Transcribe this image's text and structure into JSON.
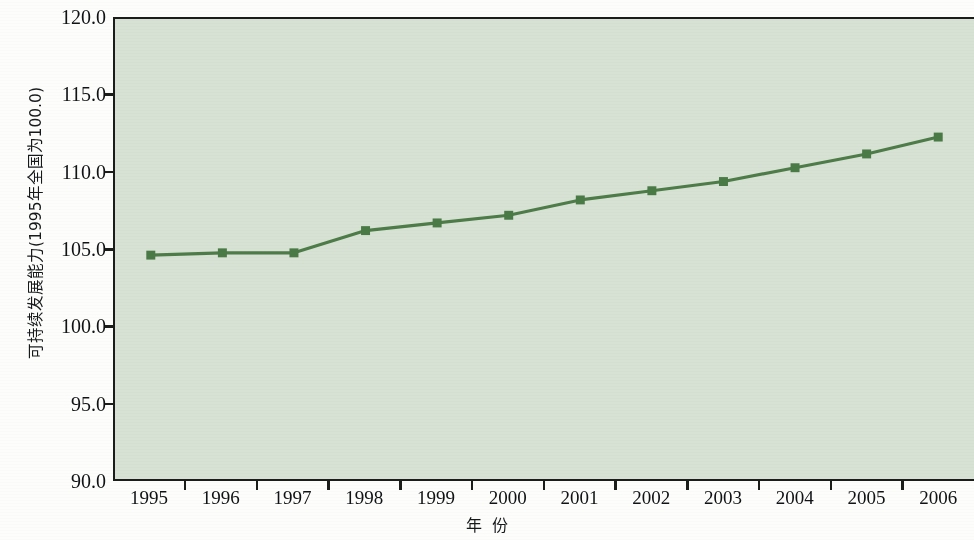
{
  "chart_data": {
    "type": "line",
    "title": "",
    "subtitle": "",
    "xlabel": "年  份",
    "ylabel": "可持续发展能力(1995年全国为100.0)",
    "categories": [
      "1995",
      "1996",
      "1997",
      "1998",
      "1999",
      "2000",
      "2001",
      "2002",
      "2003",
      "2004",
      "2005",
      "2006"
    ],
    "series": [
      {
        "name": "可持续发展能力",
        "values": [
          104.6,
          104.75,
          104.75,
          106.2,
          106.7,
          107.2,
          108.2,
          108.8,
          109.4,
          110.3,
          111.2,
          112.3
        ]
      }
    ],
    "ylim": [
      90.0,
      120.0
    ],
    "ytick_labels": [
      "120.0",
      "115.0",
      "110.0",
      "105.0",
      "100.0",
      "95.0",
      "90.0"
    ],
    "ytick_values": [
      120.0,
      115.0,
      110.0,
      105.0,
      100.0,
      95.0,
      90.0
    ],
    "grid": false,
    "legend": "none",
    "colors": {
      "plot_background": "#d7e2d5",
      "line": "#4d7c48",
      "marker": "#4a7a45",
      "axis": "#1b1d1b",
      "text": "#101214",
      "page_background": "#fdfdfb"
    },
    "marker_shape": "square",
    "line_width": 3.2,
    "marker_size": 9
  },
  "axes": {
    "y_axis_title": "可持续发展能力(1995年全国为100.0)",
    "x_axis_title_part1": "年",
    "x_axis_title_part2": "份"
  }
}
